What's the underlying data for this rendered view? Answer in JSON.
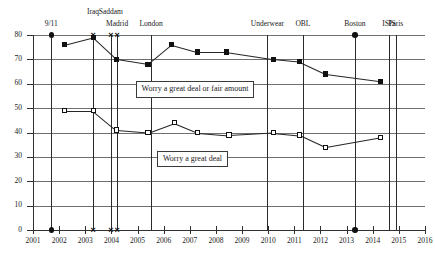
{
  "chart_data": {
    "type": "line",
    "title": "",
    "xlabel": "",
    "ylabel": "",
    "xlim": [
      2001,
      2016
    ],
    "ylim": [
      0,
      80
    ],
    "grid": true,
    "legend_position": "inline-callout",
    "y_ticks": [
      0,
      10,
      20,
      30,
      40,
      50,
      60,
      70,
      80
    ],
    "x_ticks": [
      2001,
      2002,
      2003,
      2004,
      2005,
      2006,
      2007,
      2008,
      2009,
      2010,
      2011,
      2012,
      2013,
      2014,
      2015,
      2016
    ],
    "series": [
      {
        "name": "Worry a great deal or fair amount",
        "marker": "filled-square",
        "x": [
          2002.2,
          2003.3,
          2004.2,
          2005.4,
          2006.3,
          2007.3,
          2008.4,
          2010.2,
          2011.2,
          2012.2,
          2014.3
        ],
        "values": [
          76,
          79,
          70,
          68,
          76,
          73,
          73,
          70,
          69,
          64,
          61
        ]
      },
      {
        "name": "Worry a great deal",
        "marker": "open-square",
        "x": [
          2002.2,
          2003.3,
          2004.2,
          2005.4,
          2006.4,
          2007.3,
          2008.5,
          2010.2,
          2011.2,
          2012.2,
          2014.3
        ],
        "values": [
          49,
          49,
          41,
          40,
          44,
          40,
          39,
          40,
          39,
          34,
          38
        ]
      }
    ],
    "annotations": [
      {
        "label": "9/11",
        "x": 2001.7,
        "top_marker": "dot",
        "bottom_marker": "dot",
        "row": 1
      },
      {
        "label": "Iraq",
        "x": 2003.3,
        "top_marker": "x",
        "bottom_marker": "x",
        "row": 0
      },
      {
        "label": "Saddam",
        "x": 2003.98,
        "top_marker": "x",
        "bottom_marker": "x",
        "row": 0
      },
      {
        "label": "Madrid",
        "x": 2004.22,
        "top_marker": "x",
        "bottom_marker": "x",
        "row": 1
      },
      {
        "label": "London",
        "x": 2005.52,
        "top_marker": "none",
        "bottom_marker": "none",
        "row": 1
      },
      {
        "label": "Underwear",
        "x": 2009.97,
        "top_marker": "none",
        "bottom_marker": "none",
        "row": 1
      },
      {
        "label": "OBL",
        "x": 2011.33,
        "top_marker": "none",
        "bottom_marker": "none",
        "row": 1
      },
      {
        "label": "Boston",
        "x": 2013.32,
        "top_marker": "dot",
        "bottom_marker": "dot",
        "row": 1
      },
      {
        "label": "ISIS",
        "x": 2014.62,
        "top_marker": "none",
        "bottom_marker": "none",
        "row": 1
      },
      {
        "label": "Paris",
        "x": 2014.88,
        "top_marker": "none",
        "bottom_marker": "none",
        "row": 1
      }
    ],
    "callouts": [
      {
        "text": "Worry a great deal or fair amount",
        "x": 2007.2,
        "y": 57.5
      },
      {
        "text": "Worry a great deal",
        "x": 2007.1,
        "y": 29.0
      }
    ]
  }
}
